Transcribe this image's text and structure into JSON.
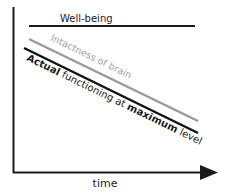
{
  "diagram": {
    "x_axis_label": "time",
    "lines": [
      {
        "id": "well-being",
        "label": "Well-being",
        "color": "#1a1a1a"
      },
      {
        "id": "intactness",
        "label": "Intactness of brain",
        "color": "#9a9a9a"
      },
      {
        "id": "actual",
        "label_parts": [
          "Actual",
          " functioning at ",
          "maximum",
          " level"
        ],
        "color": "#111111"
      }
    ]
  }
}
